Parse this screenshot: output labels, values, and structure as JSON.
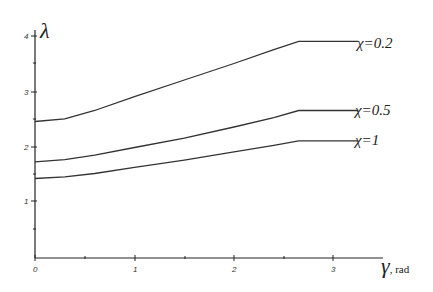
{
  "chart_data": {
    "type": "line",
    "title": "",
    "xlabel": "γ, rad",
    "xlabel_symbol": "γ",
    "xlabel_unit": ", rad",
    "ylabel": "λ",
    "xlim": [
      0,
      3.25
    ],
    "ylim": [
      0,
      4.1
    ],
    "xticks": [
      0,
      1,
      2,
      3
    ],
    "yticks": [
      1,
      2,
      3,
      4
    ],
    "grid": false,
    "legend_position": "inline-right",
    "series": [
      {
        "name": "χ=0.2",
        "x": [
          0,
          0.3,
          0.6,
          1.0,
          1.5,
          2.0,
          2.4,
          2.65,
          3.25
        ],
        "y": [
          2.45,
          2.5,
          2.65,
          2.9,
          3.2,
          3.5,
          3.75,
          3.9,
          3.9
        ]
      },
      {
        "name": "χ=0.5",
        "x": [
          0,
          0.3,
          0.6,
          1.0,
          1.5,
          2.0,
          2.4,
          2.65,
          3.25
        ],
        "y": [
          1.72,
          1.76,
          1.84,
          1.98,
          2.15,
          2.35,
          2.52,
          2.65,
          2.65
        ]
      },
      {
        "name": "χ=1",
        "x": [
          0,
          0.3,
          0.6,
          1.0,
          1.5,
          2.0,
          2.4,
          2.65,
          3.25
        ],
        "y": [
          1.42,
          1.45,
          1.51,
          1.62,
          1.75,
          1.9,
          2.02,
          2.1,
          2.1
        ]
      }
    ]
  },
  "labels": {
    "y_axis_symbol": "λ",
    "x_axis_symbol": "γ",
    "x_axis_unit": ", rad",
    "y_tick_labels": [
      "1",
      "2",
      "3",
      "4"
    ],
    "x_tick_labels": [
      "0",
      "1",
      "2",
      "3"
    ],
    "legend": [
      "χ=0.2",
      "χ=0.5",
      "χ=1"
    ]
  }
}
